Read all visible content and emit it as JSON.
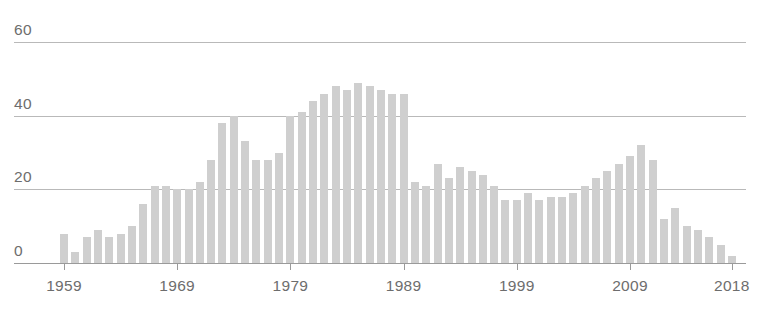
{
  "chart_data": {
    "type": "bar",
    "title": "",
    "xlabel": "",
    "ylabel": "",
    "ylim": [
      0,
      60
    ],
    "yticks": [
      0,
      20,
      40,
      60
    ],
    "xticks": [
      "1959",
      "1969",
      "1979",
      "1989",
      "1999",
      "2009",
      "2018"
    ],
    "grid": true,
    "legend": "none",
    "bar_color": "#cfcfcf",
    "axis_color": "#9a9a9a",
    "gridline_color": "#b9b9b9",
    "label_color": "#6d6d6d",
    "categories": [
      "1959",
      "1960",
      "1961",
      "1962",
      "1963",
      "1964",
      "1965",
      "1966",
      "1967",
      "1968",
      "1969",
      "1970",
      "1971",
      "1972",
      "1973",
      "1974",
      "1975",
      "1976",
      "1977",
      "1978",
      "1979",
      "1980",
      "1981",
      "1982",
      "1983",
      "1984",
      "1985",
      "1986",
      "1987",
      "1988",
      "1989",
      "1990",
      "1991",
      "1992",
      "1993",
      "1994",
      "1995",
      "1996",
      "1997",
      "1998",
      "1999",
      "2000",
      "2001",
      "2002",
      "2003",
      "2004",
      "2005",
      "2006",
      "2007",
      "2008",
      "2009",
      "2010",
      "2011",
      "2012",
      "2013",
      "2014",
      "2015",
      "2016",
      "2017",
      "2018"
    ],
    "values": [
      8,
      3,
      7,
      9,
      7,
      8,
      10,
      16,
      21,
      21,
      20,
      20,
      22,
      28,
      38,
      40,
      33,
      28,
      28,
      30,
      40,
      41,
      44,
      46,
      48,
      47,
      49,
      48,
      47,
      46,
      46,
      22,
      21,
      27,
      23,
      26,
      25,
      24,
      21,
      17,
      17,
      19,
      17,
      18,
      18,
      19,
      21,
      23,
      25,
      27,
      29,
      32,
      28,
      12,
      15,
      10,
      9,
      7,
      5,
      2
    ]
  },
  "x_axis": {
    "ticks": [
      {
        "label": "1959",
        "index": 0
      },
      {
        "label": "1969",
        "index": 10
      },
      {
        "label": "1979",
        "index": 20
      },
      {
        "label": "1989",
        "index": 30
      },
      {
        "label": "1999",
        "index": 40
      },
      {
        "label": "2009",
        "index": 50
      },
      {
        "label": "2018",
        "index": 59
      }
    ]
  },
  "y_axis": {
    "ticks": [
      {
        "label": "60",
        "value": 60
      },
      {
        "label": "40",
        "value": 40
      },
      {
        "label": "20",
        "value": 20
      },
      {
        "label": "0",
        "value": 0
      }
    ]
  },
  "top_crop_text": ""
}
